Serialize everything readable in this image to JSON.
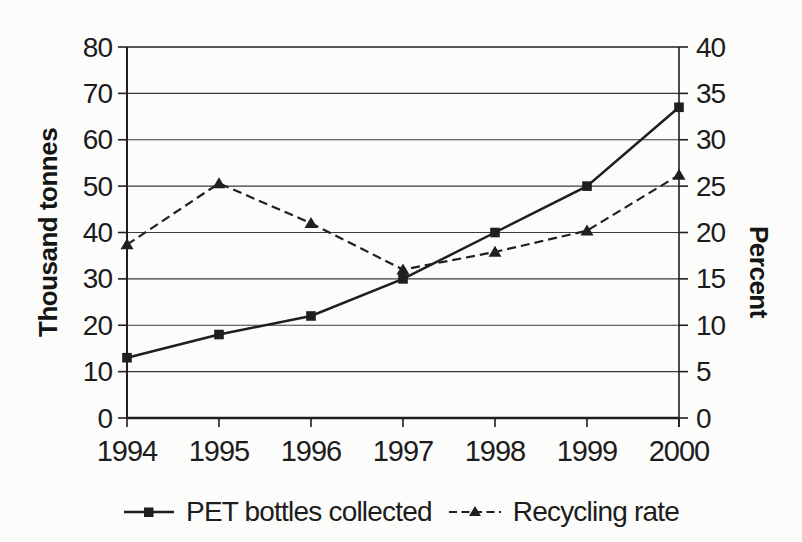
{
  "figure": {
    "background": "#fcfcfb",
    "ink_color": "#1f1f1f",
    "grid_color": "#3a3a3a"
  },
  "chart_data": {
    "type": "line",
    "title": "",
    "categories": [
      "1994",
      "1995",
      "1996",
      "1997",
      "1998",
      "1999",
      "2000"
    ],
    "series": [
      {
        "name": "PET bottles collected",
        "axis": "left",
        "line": "solid",
        "marker": "square",
        "values": [
          13,
          18,
          22,
          30,
          40,
          50,
          67
        ]
      },
      {
        "name": "Recycling rate",
        "axis": "right",
        "line": "dashed",
        "marker": "triangle",
        "values": [
          18.7,
          25.3,
          21,
          16,
          17.9,
          20.2,
          26.2
        ]
      }
    ],
    "xlabel": "",
    "ylabel_left": "Thousand tonnes",
    "ylabel_right": "Percent",
    "y_left": {
      "min": 0,
      "max": 80,
      "ticks": [
        0,
        10,
        20,
        30,
        40,
        50,
        60,
        70,
        80
      ]
    },
    "y_right": {
      "min": 0,
      "max": 40,
      "ticks": [
        0,
        5,
        10,
        15,
        20,
        25,
        30,
        35,
        40
      ]
    },
    "grid": true,
    "legend_position": "bottom"
  }
}
